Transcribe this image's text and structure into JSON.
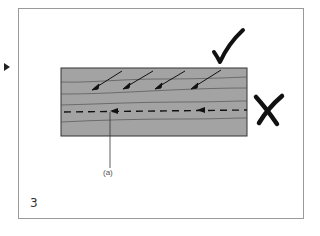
{
  "slide": {
    "number": "3",
    "label_a": "(a)"
  },
  "diagram": {
    "block_color": "#a3a3a3",
    "line_color": "#333333",
    "marks": {
      "check": "correct-direction",
      "cross": "incorrect-direction"
    }
  }
}
